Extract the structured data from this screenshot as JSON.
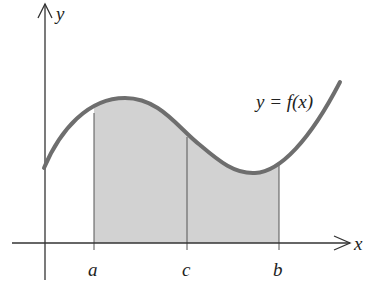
{
  "figure": {
    "type": "definite-integral-area-diagram",
    "axes": {
      "x_label": "x",
      "y_label": "y"
    },
    "curve_label": "y = f(x)",
    "ticks": [
      {
        "label": "a",
        "px": 94
      },
      {
        "label": "c",
        "px": 187
      },
      {
        "label": "b",
        "px": 279
      }
    ],
    "shaded_region": {
      "from": "a",
      "to": "b",
      "divided_at": "c"
    },
    "colors": {
      "curve": "#6e6e6e",
      "shade": "#d2d2d2",
      "axis": "#333333",
      "background": "#ffffff"
    }
  }
}
